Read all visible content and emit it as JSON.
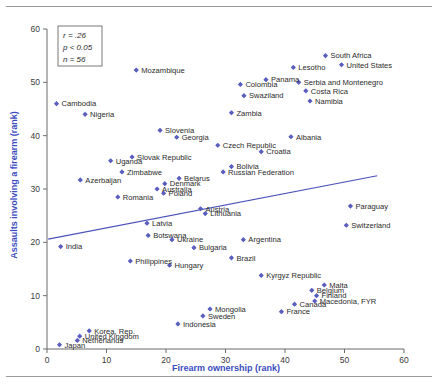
{
  "figure": {
    "background_color": "#ffffff",
    "marker_color": "#5a5fc0",
    "trendline_color": "#4a52b8",
    "axis_color": "#6b6b6b",
    "axis_title_color": "#3b4cc0",
    "label_color": "#2a2a2a"
  },
  "stats_box": {
    "r_label": "r = .26",
    "p_label": "p < 0.05",
    "n_label": "n = 56"
  },
  "chart_data": {
    "type": "scatter",
    "title": "",
    "xlabel": "Firearm ownership (rank)",
    "ylabel": "Assaults involving a firearm (rank)",
    "xlim": [
      0,
      60
    ],
    "ylim": [
      0,
      60
    ],
    "xticks": [
      0,
      10,
      20,
      30,
      40,
      50,
      60
    ],
    "yticks": [
      0,
      10,
      20,
      30,
      40,
      50,
      60
    ],
    "grid": false,
    "legend": "none",
    "annotations": [
      "r = .26",
      "p < 0.05",
      "n = 56"
    ],
    "trendline": {
      "type": "linear",
      "x_start": 0.2,
      "y_start": 20.6,
      "x_end": 55.5,
      "y_end": 32.5
    },
    "points": [
      {
        "label": "Mozambique",
        "x": 15.0,
        "y": 52.3,
        "label_pos": "right"
      },
      {
        "label": "South Africa",
        "x": 46.8,
        "y": 55.0,
        "label_pos": "right"
      },
      {
        "label": "Lesotho",
        "x": 41.4,
        "y": 52.8,
        "label_pos": "right"
      },
      {
        "label": "United States",
        "x": 49.5,
        "y": 53.3,
        "label_pos": "right"
      },
      {
        "label": "Panama",
        "x": 36.8,
        "y": 50.5,
        "label_pos": "right"
      },
      {
        "label": "Serbia and Montenegro",
        "x": 42.3,
        "y": 50.0,
        "label_pos": "right"
      },
      {
        "label": "Colombia",
        "x": 32.5,
        "y": 49.6,
        "label_pos": "right"
      },
      {
        "label": "Costa Rica",
        "x": 43.5,
        "y": 48.4,
        "label_pos": "right"
      },
      {
        "label": "Swaziland",
        "x": 33.1,
        "y": 47.5,
        "label_pos": "right"
      },
      {
        "label": "Namibia",
        "x": 44.2,
        "y": 46.5,
        "label_pos": "right"
      },
      {
        "label": "Cambodia",
        "x": 1.6,
        "y": 46.0,
        "label_pos": "right"
      },
      {
        "label": "Nigeria",
        "x": 6.4,
        "y": 44.0,
        "label_pos": "right"
      },
      {
        "label": "Zambia",
        "x": 31.0,
        "y": 44.3,
        "label_pos": "right"
      },
      {
        "label": "Slovenia",
        "x": 19.0,
        "y": 41.0,
        "label_pos": "right"
      },
      {
        "label": "Georgia",
        "x": 21.8,
        "y": 39.7,
        "label_pos": "right"
      },
      {
        "label": "Albania",
        "x": 41.0,
        "y": 39.8,
        "label_pos": "right"
      },
      {
        "label": "Czech Republic",
        "x": 28.7,
        "y": 38.2,
        "label_pos": "right"
      },
      {
        "label": "Croatia",
        "x": 36.0,
        "y": 37.0,
        "label_pos": "right"
      },
      {
        "label": "Slovak Republic",
        "x": 14.3,
        "y": 36.0,
        "label_pos": "right"
      },
      {
        "label": "Uganda",
        "x": 10.7,
        "y": 35.3,
        "label_pos": "right"
      },
      {
        "label": "Bolivia",
        "x": 31.0,
        "y": 34.2,
        "label_pos": "right"
      },
      {
        "label": "Russian Federation",
        "x": 29.6,
        "y": 33.2,
        "label_pos": "right"
      },
      {
        "label": "Zimbabwe",
        "x": 12.6,
        "y": 33.2,
        "label_pos": "right"
      },
      {
        "label": "Belarus",
        "x": 22.2,
        "y": 32.0,
        "label_pos": "right"
      },
      {
        "label": "Azerbaijan",
        "x": 5.6,
        "y": 31.7,
        "label_pos": "right"
      },
      {
        "label": "Denmark",
        "x": 19.8,
        "y": 31.0,
        "label_pos": "right"
      },
      {
        "label": "Australia",
        "x": 18.5,
        "y": 30.0,
        "label_pos": "right"
      },
      {
        "label": "Poland",
        "x": 19.6,
        "y": 29.2,
        "label_pos": "right"
      },
      {
        "label": "Romania",
        "x": 11.9,
        "y": 28.5,
        "label_pos": "right"
      },
      {
        "label": "Paraguay",
        "x": 51.0,
        "y": 26.8,
        "label_pos": "right"
      },
      {
        "label": "Austria",
        "x": 25.8,
        "y": 26.3,
        "label_pos": "right"
      },
      {
        "label": "Lithuania",
        "x": 26.6,
        "y": 25.4,
        "label_pos": "right"
      },
      {
        "label": "Switzerland",
        "x": 50.3,
        "y": 23.2,
        "label_pos": "right"
      },
      {
        "label": "Latvia",
        "x": 16.8,
        "y": 23.6,
        "label_pos": "right"
      },
      {
        "label": "Botswana",
        "x": 17.0,
        "y": 21.3,
        "label_pos": "right"
      },
      {
        "label": "Ukraine",
        "x": 21.0,
        "y": 20.5,
        "label_pos": "right"
      },
      {
        "label": "Argentina",
        "x": 33.0,
        "y": 20.5,
        "label_pos": "right"
      },
      {
        "label": "India",
        "x": 2.3,
        "y": 19.2,
        "label_pos": "right"
      },
      {
        "label": "Bulgaria",
        "x": 24.7,
        "y": 19.0,
        "label_pos": "right"
      },
      {
        "label": "Brazil",
        "x": 31.0,
        "y": 17.1,
        "label_pos": "right"
      },
      {
        "label": "Philippines",
        "x": 14.0,
        "y": 16.5,
        "label_pos": "right"
      },
      {
        "label": "Hungary",
        "x": 20.6,
        "y": 15.7,
        "label_pos": "right"
      },
      {
        "label": "Kyrgyz Republic",
        "x": 36.0,
        "y": 13.8,
        "label_pos": "right"
      },
      {
        "label": "Malta",
        "x": 46.6,
        "y": 12.0,
        "label_pos": "right"
      },
      {
        "label": "Belgium",
        "x": 44.5,
        "y": 11.0,
        "label_pos": "right"
      },
      {
        "label": "Finland",
        "x": 45.3,
        "y": 10.0,
        "label_pos": "right"
      },
      {
        "label": "Macedonia, FYR",
        "x": 45.0,
        "y": 9.0,
        "label_pos": "right"
      },
      {
        "label": "Canada",
        "x": 41.6,
        "y": 8.4,
        "label_pos": "right"
      },
      {
        "label": "Mongolia",
        "x": 27.4,
        "y": 7.5,
        "label_pos": "right"
      },
      {
        "label": "France",
        "x": 39.4,
        "y": 7.0,
        "label_pos": "right"
      },
      {
        "label": "Sweden",
        "x": 26.2,
        "y": 6.2,
        "label_pos": "right"
      },
      {
        "label": "Indonesia",
        "x": 22.0,
        "y": 4.7,
        "label_pos": "right"
      },
      {
        "label": "Korea, Rep.",
        "x": 7.1,
        "y": 3.4,
        "label_pos": "right"
      },
      {
        "label": "United Kingdom",
        "x": 5.5,
        "y": 2.4,
        "label_pos": "right"
      },
      {
        "label": "Netherlands",
        "x": 5.1,
        "y": 1.6,
        "label_pos": "right"
      },
      {
        "label": "Japan",
        "x": 2.1,
        "y": 0.8,
        "label_pos": "right"
      }
    ]
  }
}
